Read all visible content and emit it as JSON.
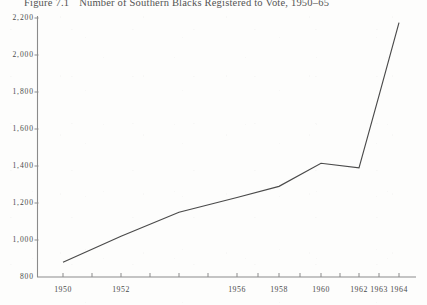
{
  "title": {
    "figure_label": "Figure 7.1",
    "caption": "Number of Southern Blacks Registered to Vote, 1950–65"
  },
  "chart_data": {
    "type": "line",
    "title": "Number of Southern Blacks Registered to Vote, 1950–65",
    "xlabel": "",
    "ylabel": "",
    "grid": false,
    "legend": false,
    "xlim": [
      1950,
      1965
    ],
    "ylim": [
      800,
      2200
    ],
    "ytick_labels": [
      "2,200",
      "2,000",
      "1,800",
      "1,600",
      "1,400",
      "1,200",
      "1,000",
      "800"
    ],
    "ytick_values": [
      2200,
      2000,
      1800,
      1600,
      1400,
      1200,
      1000,
      800
    ],
    "xtick_labels": [
      "1950",
      "1952",
      "1956",
      "1958",
      "1960",
      "1962",
      "1963",
      "1964"
    ],
    "xtick_values": [
      1950,
      1952,
      1956,
      1958,
      1960,
      1962,
      1963,
      1964
    ],
    "x": [
      1950,
      1952,
      1954,
      1956,
      1958,
      1960,
      1962,
      1963,
      1964
    ],
    "values": [
      880,
      1020,
      1150,
      1230,
      1290,
      1415,
      1390,
      1780,
      2175
    ],
    "series": [
      {
        "name": "Southern Blacks Registered to Vote (thousands)",
        "values": [
          880,
          1020,
          1150,
          1230,
          1290,
          1415,
          1390,
          1780,
          2175
        ]
      }
    ],
    "line_color": "#4a4a4a",
    "axis_color": "#8b8b8b"
  }
}
